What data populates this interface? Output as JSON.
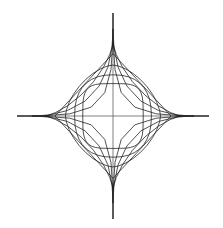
{
  "figure": {
    "type": "parametric-curve-family",
    "background_color": "#ffffff",
    "stroke_color": "#1a1a1a",
    "axis_color": "#4a4a4a",
    "stroke_width": 0.75,
    "width": 223,
    "height": 228
  },
  "chart_data": {
    "type": "line",
    "subtitle": "",
    "xlabel": "",
    "ylabel": "",
    "grid": false,
    "legend": "none",
    "equation": "|x/a|^n + |y/b|^n = 1",
    "center": {
      "x": 113,
      "y": 116
    },
    "semi_axis_x": 96,
    "semi_axis_y": 103,
    "xlim": [
      -1,
      1
    ],
    "ylim": [
      -1,
      1
    ],
    "samples_per_quadrant": 9,
    "axes": [
      {
        "name": "horizontal-axis",
        "x1": 17,
        "y1": 116,
        "x2": 209,
        "y2": 116
      },
      {
        "name": "vertical-axis",
        "x1": 113,
        "y1": 13,
        "x2": 113,
        "y2": 219
      }
    ],
    "series": [
      {
        "name": "n = 0.36",
        "exponent": 0.36,
        "scale": 1.0,
        "shape": "concave-star"
      },
      {
        "name": "n = 0.50",
        "exponent": 0.5,
        "scale": 0.845,
        "shape": "astroid"
      },
      {
        "name": "n = 0.70",
        "exponent": 0.7,
        "scale": 0.715,
        "shape": "concave-diamond"
      },
      {
        "name": "n = 1.00",
        "exponent": 1.0,
        "scale": 0.605,
        "shape": "diamond"
      },
      {
        "name": "n = 1.60",
        "exponent": 1.6,
        "scale": 0.495,
        "shape": "rounded-diamond"
      },
      {
        "name": "n = 2.40",
        "exponent": 2.4,
        "scale": 0.4,
        "shape": "ellipse"
      },
      {
        "name": "n = 4.00",
        "exponent": 4.0,
        "scale": 0.315,
        "shape": "squircle"
      }
    ],
    "vertex_markers_x": [
      17,
      42,
      58,
      71,
      82,
      92,
      100,
      113,
      126,
      134,
      144,
      155,
      168,
      184,
      209
    ],
    "vertex_markers_y": [
      13,
      40,
      57,
      71,
      84,
      95,
      104,
      116,
      128,
      137,
      148,
      161,
      175,
      192,
      219
    ]
  }
}
